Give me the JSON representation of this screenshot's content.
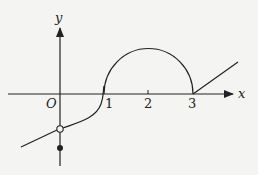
{
  "figure": {
    "type": "function-graph",
    "axes": {
      "x_label": "x",
      "y_label": "y",
      "origin_label": "O",
      "x_ticks": [
        "1",
        "2",
        "3"
      ]
    },
    "curve_segments": [
      {
        "name": "left-line",
        "description": "line segment for x<0 ending at an open circle on the y-axis"
      },
      {
        "name": "s-curve",
        "description": "curve from the open circle rising through (1,0)"
      },
      {
        "name": "semicircle",
        "description": "upper semicircle centered at (2,0) with radius 1"
      },
      {
        "name": "right-ray",
        "description": "ray starting at (3,0) going up-right"
      }
    ],
    "points": [
      {
        "name": "open-circle",
        "filled": false,
        "on": "y-axis"
      },
      {
        "name": "filled-dot",
        "filled": true,
        "on": "y-axis"
      }
    ],
    "colors": {
      "stroke": "#222222",
      "background": "#f4f4f2"
    }
  }
}
